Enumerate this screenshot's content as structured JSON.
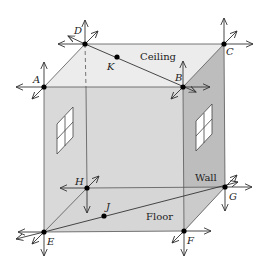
{
  "diagram": {
    "type": "3D cube room with labeled vertices and lines",
    "faces": {
      "ceiling": {
        "label": "Ceiling",
        "color": "#ececec"
      },
      "front_wall": {
        "color": "#d9d9d9"
      },
      "side_wall": {
        "label": "Wall",
        "color": "#bdbdbd"
      },
      "floor": {
        "label": "Floor",
        "color": "#d4d4d4"
      }
    },
    "vertices": {
      "A": {
        "label": "A",
        "x": 44,
        "y": 87
      },
      "B": {
        "label": "B",
        "x": 183,
        "y": 87
      },
      "C": {
        "label": "C",
        "x": 224,
        "y": 44
      },
      "D": {
        "label": "D",
        "x": 85,
        "y": 44
      },
      "E": {
        "label": "E",
        "x": 44,
        "y": 232
      },
      "F": {
        "label": "F",
        "x": 184,
        "y": 231
      },
      "G": {
        "label": "G",
        "x": 225,
        "y": 187
      },
      "H": {
        "label": "H",
        "x": 87,
        "y": 188
      }
    },
    "points": {
      "K": {
        "label": "K",
        "x": 117,
        "y": 57
      },
      "J": {
        "label": "J",
        "x": 104,
        "y": 216
      }
    },
    "colors": {
      "line": "#333333",
      "point": "#000000"
    }
  }
}
